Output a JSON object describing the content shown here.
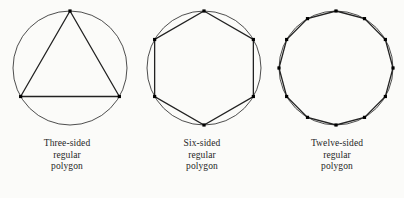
{
  "figure": {
    "background_color": "#fbfbf9",
    "stroke_color": "#3a3a3a",
    "polygon_color": "#222222",
    "vertex_color": "#000000",
    "panels": [
      {
        "id": "three-sided",
        "sides": 3,
        "caption_lines": [
          "Three-sided",
          "regular",
          "polygon"
        ],
        "circle": {
          "cx": 70,
          "cy": 68,
          "r": 57
        },
        "rotation_deg": -90,
        "vertex_count": 3
      },
      {
        "id": "six-sided",
        "sides": 6,
        "caption_lines": [
          "Six-sided",
          "regular",
          "polygon"
        ],
        "circle": {
          "cx": 69,
          "cy": 68,
          "r": 57
        },
        "rotation_deg": -90,
        "vertex_count": 6
      },
      {
        "id": "twelve-sided",
        "sides": 12,
        "caption_lines": [
          "Twelve-sided",
          "regular",
          "polygon"
        ],
        "circle": {
          "cx": 66,
          "cy": 68,
          "r": 57
        },
        "rotation_deg": -90,
        "vertex_count": 12
      }
    ]
  },
  "chart_data": {
    "type": "diagram",
    "series": [
      {
        "name": "Three-sided regular polygon",
        "sides": 3,
        "inscribed_in_circle": true,
        "vertices_marked": 3
      },
      {
        "name": "Six-sided regular polygon",
        "sides": 6,
        "inscribed_in_circle": true,
        "vertices_marked": 6
      },
      {
        "name": "Twelve-sided regular polygon",
        "sides": 12,
        "inscribed_in_circle": true,
        "vertices_marked": 12
      }
    ],
    "xlabel": "",
    "ylabel": "",
    "legend": "none",
    "grid": false
  }
}
